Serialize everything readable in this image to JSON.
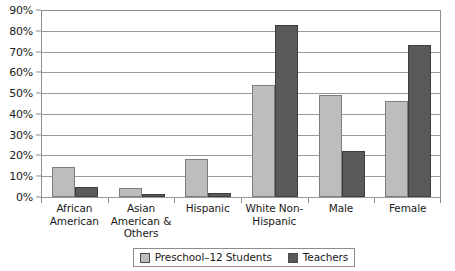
{
  "chart_data": {
    "type": "bar",
    "title": "",
    "subtitle": "",
    "xlabel": "",
    "ylabel": "",
    "ylim": [
      0,
      90
    ],
    "ytick_labels": [
      "0%",
      "10%",
      "20%",
      "30%",
      "40%",
      "50%",
      "60%",
      "70%",
      "80%",
      "90%"
    ],
    "ytick_values": [
      0,
      10,
      20,
      30,
      40,
      50,
      60,
      70,
      80,
      90
    ],
    "grid": true,
    "legend_position": "bottom",
    "categories": [
      "African American",
      "Asian American & Others",
      "Hispanic",
      "White Non-Hispanic",
      "Male",
      "Female"
    ],
    "category_lines": [
      [
        "African",
        "American"
      ],
      [
        "Asian",
        "American &",
        "Others"
      ],
      [
        "Hispanic"
      ],
      [
        "White Non-",
        "Hispanic"
      ],
      [
        "Male"
      ],
      [
        "Female"
      ]
    ],
    "series": [
      {
        "name": "Preschool–12 Students",
        "color": "#bdbdbd",
        "values": [
          14.5,
          4.5,
          18.5,
          54,
          49,
          46
        ]
      },
      {
        "name": "Teachers",
        "color": "#5a5a5a",
        "values": [
          5,
          1.5,
          2,
          83,
          22,
          73
        ]
      }
    ]
  },
  "legend": {
    "items": [
      {
        "label": "Preschool–12 Students",
        "swatch": "students"
      },
      {
        "label": "Teachers",
        "swatch": "teachers"
      }
    ]
  },
  "colors": {
    "students": "#bdbdbd",
    "teachers": "#5a5a5a",
    "grid": "#9a9a9a",
    "axis": "#8c8c8c",
    "text": "#1a1a1a",
    "background": "#ffffff"
  }
}
